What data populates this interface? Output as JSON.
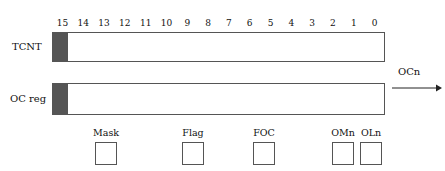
{
  "diagram": {
    "line_color": "#555555",
    "text_color": "#111111",
    "background": "#ffffff"
  },
  "tcnt": {
    "label": "TCNT",
    "bit_numbers": [
      "15",
      "14",
      "13",
      "12",
      "11",
      "10",
      "9",
      "8",
      "7",
      "6",
      "5",
      "4",
      "3",
      "2",
      "1",
      "0"
    ],
    "cell_count": 16,
    "cell_values": [
      "",
      "",
      "",
      "",
      "",
      "",
      "",
      "",
      "",
      "",
      "",
      "",
      "",
      "",
      "",
      ""
    ]
  },
  "oc_reg": {
    "label": "OC reg",
    "cell_count": 16,
    "cell_values": [
      "",
      "",
      "",
      "",
      "",
      "",
      "",
      "",
      "",
      "",
      "",
      "",
      "",
      "",
      "",
      ""
    ]
  },
  "control_bits": [
    {
      "label": "Mask",
      "value": ""
    },
    {
      "label": "Flag",
      "value": ""
    },
    {
      "label": "FOC",
      "value": ""
    },
    {
      "label": "OMn",
      "value": ""
    },
    {
      "label": "OLn",
      "value": ""
    }
  ],
  "output": {
    "label": "OCn",
    "arrow_icon": "arrow-right-icon"
  }
}
